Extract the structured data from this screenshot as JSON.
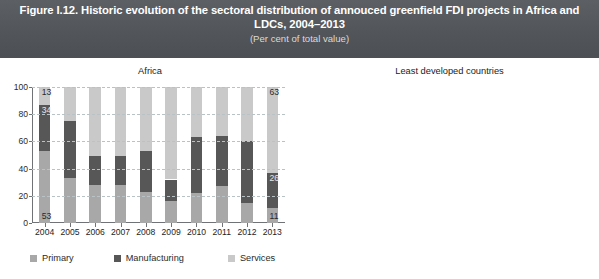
{
  "figure": {
    "title": "Figure I.12. Historic evolution of the sectoral distribution of annouced greenfield FDI projects in Africa and LDCs, 2004–2013",
    "subtitle": "(Per cent of total value)",
    "banner_color": "#55585c"
  },
  "legend": {
    "items": [
      {
        "label": "Primary",
        "color": "#a8a8a8",
        "key": "primary"
      },
      {
        "label": "Manufacturing",
        "color": "#575757",
        "key": "manufacturing"
      },
      {
        "label": "Services",
        "color": "#c9c9c9",
        "key": "services"
      }
    ]
  },
  "axis": {
    "y_ticks": [
      "0",
      "20",
      "40",
      "60",
      "80",
      "100"
    ],
    "y_min": 0,
    "y_max": 100
  },
  "chart_data": [
    {
      "type": "bar",
      "title": "Africa",
      "subtype": "stacked-bar",
      "xlabel": "",
      "ylabel": "",
      "ylim": [
        0,
        100
      ],
      "grid": true,
      "legend_position": "bottom",
      "categories": [
        "2004",
        "2005",
        "2006",
        "2007",
        "2008",
        "2009",
        "2010",
        "2011",
        "2012",
        "2013"
      ],
      "series": [
        {
          "name": "Primary",
          "color": "#a8a8a8",
          "values": [
            53,
            33,
            28,
            28,
            23,
            16,
            22,
            27,
            15,
            11
          ]
        },
        {
          "name": "Manufacturing",
          "color": "#575757",
          "values": [
            34,
            42,
            21,
            21,
            30,
            16,
            41,
            37,
            45,
            26
          ]
        },
        {
          "name": "Services",
          "color": "#c9c9c9",
          "values": [
            13,
            25,
            51,
            51,
            47,
            68,
            37,
            36,
            40,
            63
          ]
        }
      ],
      "data_labels": [
        {
          "category": "2004",
          "series": "Primary",
          "value": "53"
        },
        {
          "category": "2004",
          "series": "Manufacturing",
          "value": "34"
        },
        {
          "category": "2004",
          "series": "Services",
          "value": "13"
        },
        {
          "category": "2013",
          "series": "Primary",
          "value": "11"
        },
        {
          "category": "2013",
          "series": "Manufacturing",
          "value": "26"
        },
        {
          "category": "2013",
          "series": "Services",
          "value": "63"
        }
      ]
    },
    {
      "type": "bar",
      "title": "Least developed countries",
      "subtype": "stacked-bar",
      "xlabel": "",
      "ylabel": "",
      "ylim": [
        0,
        100
      ],
      "grid": true,
      "legend_position": "bottom",
      "categories": [
        "2004",
        "2005",
        "2006",
        "2007",
        "2008",
        "2009",
        "2010",
        "2011",
        "2012",
        "2013"
      ],
      "series": [
        {
          "name": "Primary",
          "color": "#a8a8a8",
          "values": [
            74,
            54,
            36,
            52,
            39,
            33,
            29,
            34,
            20,
            9
          ]
        },
        {
          "name": "Manufacturing",
          "color": "#575757",
          "values": [
            16,
            35,
            24,
            23,
            23,
            25,
            45,
            36,
            30,
            21
          ]
        },
        {
          "name": "Services",
          "color": "#c9c9c9",
          "values": [
            10,
            11,
            40,
            25,
            38,
            42,
            26,
            30,
            50,
            70
          ]
        }
      ],
      "data_labels": [
        {
          "category": "2004",
          "series": "Primary",
          "value": "74"
        },
        {
          "category": "2004",
          "series": "Manufacturing",
          "value": "16"
        },
        {
          "category": "2004",
          "series": "Services",
          "value": "10"
        },
        {
          "category": "2013",
          "series": "Primary",
          "value": "9"
        },
        {
          "category": "2013",
          "series": "Manufacturing",
          "value": "21"
        },
        {
          "category": "2013",
          "series": "Services",
          "value": "70"
        }
      ]
    }
  ]
}
